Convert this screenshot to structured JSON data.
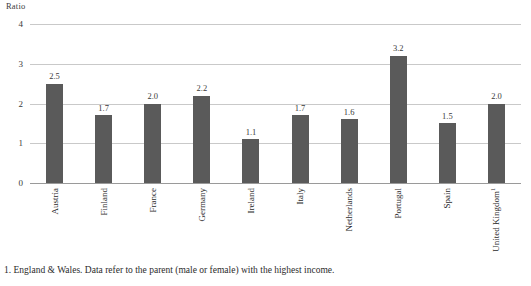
{
  "chart_data": {
    "type": "bar",
    "title": "",
    "subtitle": "",
    "xlabel": "",
    "ylabel": "Ratio",
    "ylim": [
      0,
      4
    ],
    "ytick_labels": [
      "0",
      "1",
      "2",
      "3",
      "4"
    ],
    "ytick_values": [
      0,
      1,
      2,
      3,
      4
    ],
    "grid": true,
    "legend": false,
    "legend_position": "none",
    "bar_color": "#5a5a5a",
    "gridline_color": "#c9c9c9",
    "axis_color": "#9a9a9a",
    "categories": [
      "Austria",
      "Finland",
      "France",
      "Germany",
      "Ireland",
      "Italy",
      "Netherlands",
      "Portugal",
      "Spain",
      "United Kingdom"
    ],
    "category_superscripts": [
      "",
      "",
      "",
      "",
      "",
      "",
      "",
      "",
      "",
      "1"
    ],
    "values": [
      2.5,
      1.7,
      2.0,
      2.2,
      1.1,
      1.7,
      1.6,
      3.2,
      1.5,
      2.0
    ],
    "value_labels": [
      "2.5",
      "1.7",
      "2.0",
      "2.2",
      "1.1",
      "1.7",
      "1.6",
      "3.2",
      "1.5",
      "2.0"
    ],
    "annotations": [
      "1. England & Wales. Data refer to the parent (male or female) with the highest income."
    ]
  },
  "footnote": {
    "text": "1. England & Wales. Data refer to the parent (male or female) with the highest income."
  }
}
